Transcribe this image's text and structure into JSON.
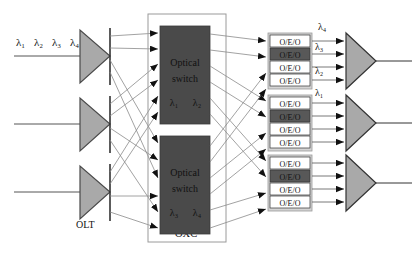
{
  "figure": {
    "type": "diagram"
  },
  "colors": {
    "triangle_fill": "#a9a9a9",
    "switch_fill": "#4a4a4a",
    "oeo_white": "#ffffff",
    "oeo_shaded": "#585858",
    "oeo_group_bg": "#d4d4d4",
    "line": "#8a8a8a",
    "arrow": "#111111",
    "box_border": "#9a9a9a",
    "text": "#111111",
    "background": "#ffffff"
  },
  "input_labels": {
    "lambda1": "λ₁",
    "lambda2": "λ₂",
    "lambda3": "λ₃",
    "lambda4": "λ₄"
  },
  "olt": {
    "label": "OLT",
    "count": 3
  },
  "oxc": {
    "label": "OXC",
    "switches": [
      {
        "name": "optical-switch-top",
        "line1": "Optical",
        "line2": "switch",
        "wavelengths": [
          "λ₁",
          "λ₂"
        ],
        "inputs": 6,
        "outputs": 6
      },
      {
        "name": "optical-switch-bottom",
        "line1": "Optical",
        "line2": "switch",
        "wavelengths": [
          "λ₃",
          "λ₄"
        ],
        "inputs": 6,
        "outputs": 6
      }
    ]
  },
  "oeo": {
    "label": "O/E/O",
    "groups": [
      {
        "name": "oeo-group-1",
        "boxes": [
          {
            "label": "O/E/O",
            "shaded": false
          },
          {
            "label": "O/E/O",
            "shaded": true
          },
          {
            "label": "O/E/O",
            "shaded": false
          },
          {
            "label": "O/E/O",
            "shaded": false
          }
        ]
      },
      {
        "name": "oeo-group-2",
        "boxes": [
          {
            "label": "O/E/O",
            "shaded": false
          },
          {
            "label": "O/E/O",
            "shaded": true
          },
          {
            "label": "O/E/O",
            "shaded": false
          },
          {
            "label": "O/E/O",
            "shaded": false
          }
        ]
      },
      {
        "name": "oeo-group-3",
        "boxes": [
          {
            "label": "O/E/O",
            "shaded": false
          },
          {
            "label": "O/E/O",
            "shaded": true
          },
          {
            "label": "O/E/O",
            "shaded": false
          },
          {
            "label": "O/E/O",
            "shaded": false
          }
        ]
      }
    ]
  },
  "output_labels": {
    "lambda4": "λ₄",
    "lambda3": "λ₃",
    "lambda2": "λ₂",
    "lambda1": "λ₁"
  },
  "output_combiners": {
    "count": 3
  }
}
